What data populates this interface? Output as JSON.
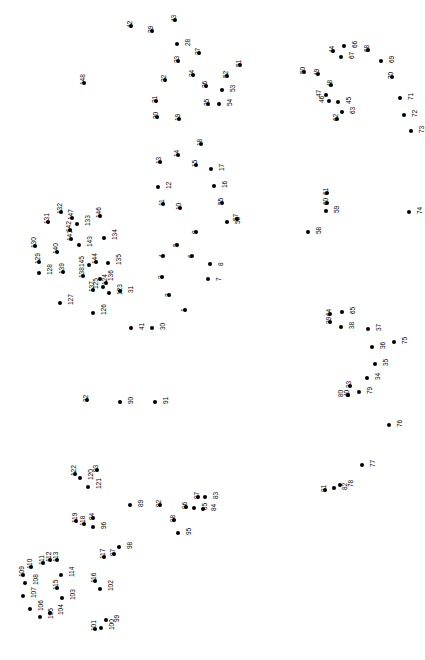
{
  "puzzle": {
    "type": "connect-the-dots",
    "title": "Connect the Dots",
    "dot_count": 148,
    "canvas": {
      "width": 425,
      "height": 660
    },
    "background_color": "#ffffff",
    "dot_color": "#000000",
    "label_color": "#000000",
    "label_rotation_deg": -90,
    "dots": [
      {
        "n": 1,
        "x": 185,
        "y": 310,
        "lp": "lab-left"
      },
      {
        "n": 2,
        "x": 169,
        "y": 295,
        "lp": "lab-left"
      },
      {
        "n": 3,
        "x": 162,
        "y": 277,
        "lp": "lab-left"
      },
      {
        "n": 4,
        "x": 163,
        "y": 256,
        "lp": "lab-left"
      },
      {
        "n": 5,
        "x": 177,
        "y": 245,
        "lp": "lab-left"
      },
      {
        "n": 6,
        "x": 192,
        "y": 256,
        "lp": "lab-left"
      },
      {
        "n": 7,
        "x": 208,
        "y": 279,
        "lp": "lab-right"
      },
      {
        "n": 8,
        "x": 210,
        "y": 264,
        "lp": "lab-right"
      },
      {
        "n": 9,
        "x": 196,
        "y": 232,
        "lp": "lab-left"
      },
      {
        "n": 10,
        "x": 180,
        "y": 208,
        "lp": "lab-left"
      },
      {
        "n": 11,
        "x": 163,
        "y": 204,
        "lp": "lab-left"
      },
      {
        "n": 12,
        "x": 158,
        "y": 187,
        "lp": "lab-right"
      },
      {
        "n": 13,
        "x": 160,
        "y": 162,
        "lp": "lab-left"
      },
      {
        "n": 14,
        "x": 178,
        "y": 155,
        "lp": "lab-left"
      },
      {
        "n": 15,
        "x": 196,
        "y": 165,
        "lp": "lab-left"
      },
      {
        "n": 16,
        "x": 214,
        "y": 186,
        "lp": "lab-right"
      },
      {
        "n": 17,
        "x": 211,
        "y": 169,
        "lp": "lab-right"
      },
      {
        "n": 18,
        "x": 201,
        "y": 144,
        "lp": "lab-left"
      },
      {
        "n": 19,
        "x": 179,
        "y": 119,
        "lp": "lab-left"
      },
      {
        "n": 20,
        "x": 157,
        "y": 117,
        "lp": "lab-left"
      },
      {
        "n": 21,
        "x": 156,
        "y": 101,
        "lp": "lab-left"
      },
      {
        "n": 22,
        "x": 165,
        "y": 80,
        "lp": "lab-left"
      },
      {
        "n": 23,
        "x": 178,
        "y": 61,
        "lp": "lab-left"
      },
      {
        "n": 24,
        "x": 193,
        "y": 75,
        "lp": "lab-left"
      },
      {
        "n": 25,
        "x": 208,
        "y": 104,
        "lp": "lab-left"
      },
      {
        "n": 26,
        "x": 206,
        "y": 86,
        "lp": "lab-left"
      },
      {
        "n": 27,
        "x": 199,
        "y": 53,
        "lp": "lab-left"
      },
      {
        "n": 28,
        "x": 177,
        "y": 44,
        "lp": "lab-right"
      },
      {
        "n": 29,
        "x": 152,
        "y": 31,
        "lp": "lab-left"
      },
      {
        "n": 30,
        "x": 152,
        "y": 328,
        "lp": "lab-right"
      },
      {
        "n": 31,
        "x": 120,
        "y": 291,
        "lp": "lab-right"
      },
      {
        "n": 32,
        "x": 87,
        "y": 400,
        "lp": "lab-left"
      },
      {
        "n": 33,
        "x": 350,
        "y": 386,
        "lp": "lab-left"
      },
      {
        "n": 34,
        "x": 367,
        "y": 378,
        "lp": "lab-right"
      },
      {
        "n": 35,
        "x": 375,
        "y": 364,
        "lp": "lab-right"
      },
      {
        "n": 36,
        "x": 372,
        "y": 347,
        "lp": "lab-right"
      },
      {
        "n": 37,
        "x": 368,
        "y": 329,
        "lp": "lab-right"
      },
      {
        "n": 38,
        "x": 341,
        "y": 327,
        "lp": "lab-right"
      },
      {
        "n": 39,
        "x": 330,
        "y": 322,
        "lp": "lab-left"
      },
      {
        "n": 40,
        "x": 348,
        "y": 395,
        "lp": "lab-left"
      },
      {
        "n": 41,
        "x": 131,
        "y": 328,
        "lp": "lab-right"
      },
      {
        "n": 42,
        "x": 131,
        "y": 26,
        "lp": "lab-left"
      },
      {
        "n": 43,
        "x": 175,
        "y": 20,
        "lp": "lab-left"
      },
      {
        "n": 44,
        "x": 333,
        "y": 51,
        "lp": "lab-left"
      },
      {
        "n": 45,
        "x": 338,
        "y": 102,
        "lp": "lab-right"
      },
      {
        "n": 46,
        "x": 329,
        "y": 101,
        "lp": "lab-left2"
      },
      {
        "n": 47,
        "x": 326,
        "y": 95,
        "lp": "lab-left2"
      },
      {
        "n": 48,
        "x": 331,
        "y": 85,
        "lp": "lab-left"
      },
      {
        "n": 49,
        "x": 318,
        "y": 74,
        "lp": "lab-left"
      },
      {
        "n": 50,
        "x": 304,
        "y": 72,
        "lp": "lab-left"
      },
      {
        "n": 51,
        "x": 240,
        "y": 65,
        "lp": "lab-left"
      },
      {
        "n": 52,
        "x": 227,
        "y": 76,
        "lp": "lab-left"
      },
      {
        "n": 53,
        "x": 222,
        "y": 90,
        "lp": "lab-right"
      },
      {
        "n": 54,
        "x": 219,
        "y": 104,
        "lp": "lab-right"
      },
      {
        "n": 55,
        "x": 222,
        "y": 203,
        "lp": "lab-left"
      },
      {
        "n": 56,
        "x": 227,
        "y": 222,
        "lp": "lab-right"
      },
      {
        "n": 57,
        "x": 237,
        "y": 219,
        "lp": "lab-left"
      },
      {
        "n": 58,
        "x": 308,
        "y": 232,
        "lp": "lab-right"
      },
      {
        "n": 59,
        "x": 326,
        "y": 211,
        "lp": "lab-right"
      },
      {
        "n": 60,
        "x": 327,
        "y": 203,
        "lp": "lab-left"
      },
      {
        "n": 61,
        "x": 327,
        "y": 193,
        "lp": "lab-left"
      },
      {
        "n": 62,
        "x": 337,
        "y": 119,
        "lp": "lab-left"
      },
      {
        "n": 63,
        "x": 342,
        "y": 112,
        "lp": "lab-right"
      },
      {
        "n": 64,
        "x": 330,
        "y": 314,
        "lp": "lab-left"
      },
      {
        "n": 65,
        "x": 342,
        "y": 312,
        "lp": "lab-right"
      },
      {
        "n": 66,
        "x": 344,
        "y": 46,
        "lp": "lab-right"
      },
      {
        "n": 67,
        "x": 341,
        "y": 57,
        "lp": "lab-right"
      },
      {
        "n": 68,
        "x": 368,
        "y": 50,
        "lp": "lab-left"
      },
      {
        "n": 69,
        "x": 381,
        "y": 61,
        "lp": "lab-right"
      },
      {
        "n": 70,
        "x": 392,
        "y": 77,
        "lp": "lab-left"
      },
      {
        "n": 71,
        "x": 400,
        "y": 98,
        "lp": "lab-right"
      },
      {
        "n": 72,
        "x": 404,
        "y": 115,
        "lp": "lab-right"
      },
      {
        "n": 73,
        "x": 411,
        "y": 131,
        "lp": "lab-right"
      },
      {
        "n": 74,
        "x": 409,
        "y": 212,
        "lp": "lab-right"
      },
      {
        "n": 75,
        "x": 394,
        "y": 342,
        "lp": "lab-right"
      },
      {
        "n": 76,
        "x": 389,
        "y": 425,
        "lp": "lab-right"
      },
      {
        "n": 77,
        "x": 362,
        "y": 465,
        "lp": "lab-right"
      },
      {
        "n": 78,
        "x": 340,
        "y": 485,
        "lp": "lab-right"
      },
      {
        "n": 79,
        "x": 359,
        "y": 392,
        "lp": "lab-right"
      },
      {
        "n": 80,
        "x": 348,
        "y": 395,
        "lp": "lab-left2"
      },
      {
        "n": 81,
        "x": 325,
        "y": 490,
        "lp": "lab-left"
      },
      {
        "n": 82,
        "x": 334,
        "y": 488,
        "lp": "lab-right"
      },
      {
        "n": 83,
        "x": 205,
        "y": 497,
        "lp": "lab-right"
      },
      {
        "n": 84,
        "x": 203,
        "y": 509,
        "lp": "lab-right"
      },
      {
        "n": 85,
        "x": 194,
        "y": 508,
        "lp": "lab-right"
      },
      {
        "n": 86,
        "x": 186,
        "y": 507,
        "lp": "lab-left"
      },
      {
        "n": 87,
        "x": 198,
        "y": 497,
        "lp": "lab-left"
      },
      {
        "n": 88,
        "x": 174,
        "y": 520,
        "lp": "lab-left"
      },
      {
        "n": 89,
        "x": 130,
        "y": 505,
        "lp": "lab-right"
      },
      {
        "n": 90,
        "x": 120,
        "y": 402,
        "lp": "lab-right"
      },
      {
        "n": 91,
        "x": 155,
        "y": 402,
        "lp": "lab-right"
      },
      {
        "n": 92,
        "x": 160,
        "y": 505,
        "lp": "lab-left"
      },
      {
        "n": 93,
        "x": 97,
        "y": 470,
        "lp": "lab-left"
      },
      {
        "n": 94,
        "x": 93,
        "y": 518,
        "lp": "lab-left"
      },
      {
        "n": 95,
        "x": 178,
        "y": 533,
        "lp": "lab-right"
      },
      {
        "n": 96,
        "x": 93,
        "y": 527,
        "lp": "lab-right"
      },
      {
        "n": 97,
        "x": 114,
        "y": 554,
        "lp": "lab-left"
      },
      {
        "n": 98,
        "x": 119,
        "y": 547,
        "lp": "lab-right"
      },
      {
        "n": 99,
        "x": 106,
        "y": 620,
        "lp": "lab-right"
      },
      {
        "n": 100,
        "x": 101,
        "y": 628,
        "lp": "lab-right"
      },
      {
        "n": 101,
        "x": 95,
        "y": 629,
        "lp": "lab-left"
      },
      {
        "n": 102,
        "x": 100,
        "y": 589,
        "lp": "lab-right"
      },
      {
        "n": 103,
        "x": 62,
        "y": 598,
        "lp": "lab-right"
      },
      {
        "n": 104,
        "x": 50,
        "y": 613,
        "lp": "lab-right"
      },
      {
        "n": 105,
        "x": 40,
        "y": 617,
        "lp": "lab-right"
      },
      {
        "n": 106,
        "x": 30,
        "y": 609,
        "lp": "lab-right"
      },
      {
        "n": 107,
        "x": 23,
        "y": 596,
        "lp": "lab-right"
      },
      {
        "n": 108,
        "x": 25,
        "y": 583,
        "lp": "lab-right"
      },
      {
        "n": 109,
        "x": 23,
        "y": 575,
        "lp": "lab-left"
      },
      {
        "n": 110,
        "x": 31,
        "y": 567,
        "lp": "lab-left"
      },
      {
        "n": 111,
        "x": 43,
        "y": 563,
        "lp": "lab-left"
      },
      {
        "n": 112,
        "x": 50,
        "y": 560,
        "lp": "lab-left"
      },
      {
        "n": 113,
        "x": 57,
        "y": 560,
        "lp": "lab-left"
      },
      {
        "n": 114,
        "x": 61,
        "y": 575,
        "lp": "lab-right"
      },
      {
        "n": 115,
        "x": 57,
        "y": 588,
        "lp": "lab-left"
      },
      {
        "n": 116,
        "x": 95,
        "y": 581,
        "lp": "lab-left"
      },
      {
        "n": 117,
        "x": 104,
        "y": 557,
        "lp": "lab-left"
      },
      {
        "n": 118,
        "x": 84,
        "y": 524,
        "lp": "lab-left"
      },
      {
        "n": 119,
        "x": 76,
        "y": 521,
        "lp": "lab-left"
      },
      {
        "n": 120,
        "x": 80,
        "y": 478,
        "lp": "lab-right"
      },
      {
        "n": 121,
        "x": 88,
        "y": 487,
        "lp": "lab-right"
      },
      {
        "n": 122,
        "x": 75,
        "y": 474,
        "lp": "lab-left"
      },
      {
        "n": 123,
        "x": 109,
        "y": 293,
        "lp": "lab-right"
      },
      {
        "n": 124,
        "x": 106,
        "y": 283,
        "lp": "lab-left"
      },
      {
        "n": 125,
        "x": 103,
        "y": 287,
        "lp": "lab-left2"
      },
      {
        "n": 126,
        "x": 93,
        "y": 313,
        "lp": "lab-right"
      },
      {
        "n": 127,
        "x": 60,
        "y": 303,
        "lp": "lab-right"
      },
      {
        "n": 128,
        "x": 39,
        "y": 273,
        "lp": "lab-right"
      },
      {
        "n": 129,
        "x": 39,
        "y": 262,
        "lp": "lab-left"
      },
      {
        "n": 130,
        "x": 35,
        "y": 246,
        "lp": "lab-left"
      },
      {
        "n": 131,
        "x": 48,
        "y": 222,
        "lp": "lab-left"
      },
      {
        "n": 132,
        "x": 61,
        "y": 212,
        "lp": "lab-left"
      },
      {
        "n": 133,
        "x": 77,
        "y": 224,
        "lp": "lab-right"
      },
      {
        "n": 134,
        "x": 104,
        "y": 238,
        "lp": "lab-right"
      },
      {
        "n": 135,
        "x": 108,
        "y": 263,
        "lp": "lab-right"
      },
      {
        "n": 136,
        "x": 100,
        "y": 279,
        "lp": "lab-right"
      },
      {
        "n": 137,
        "x": 93,
        "y": 290,
        "lp": "lab-left"
      },
      {
        "n": 138,
        "x": 83,
        "y": 276,
        "lp": "lab-left"
      },
      {
        "n": 139,
        "x": 63,
        "y": 272,
        "lp": "lab-left"
      },
      {
        "n": 140,
        "x": 57,
        "y": 252,
        "lp": "lab-left"
      },
      {
        "n": 141,
        "x": 71,
        "y": 239,
        "lp": "lab-left"
      },
      {
        "n": 142,
        "x": 70,
        "y": 230,
        "lp": "lab-left"
      },
      {
        "n": 143,
        "x": 79,
        "y": 245,
        "lp": "lab-right"
      },
      {
        "n": 144,
        "x": 96,
        "y": 262,
        "lp": "lab-left"
      },
      {
        "n": 145,
        "x": 89,
        "y": 265,
        "lp": "lab-left2"
      },
      {
        "n": 146,
        "x": 100,
        "y": 216,
        "lp": "lab-left"
      },
      {
        "n": 147,
        "x": 72,
        "y": 218,
        "lp": "lab-left"
      },
      {
        "n": 148,
        "x": 84,
        "y": 83,
        "lp": "lab-left"
      }
    ]
  }
}
